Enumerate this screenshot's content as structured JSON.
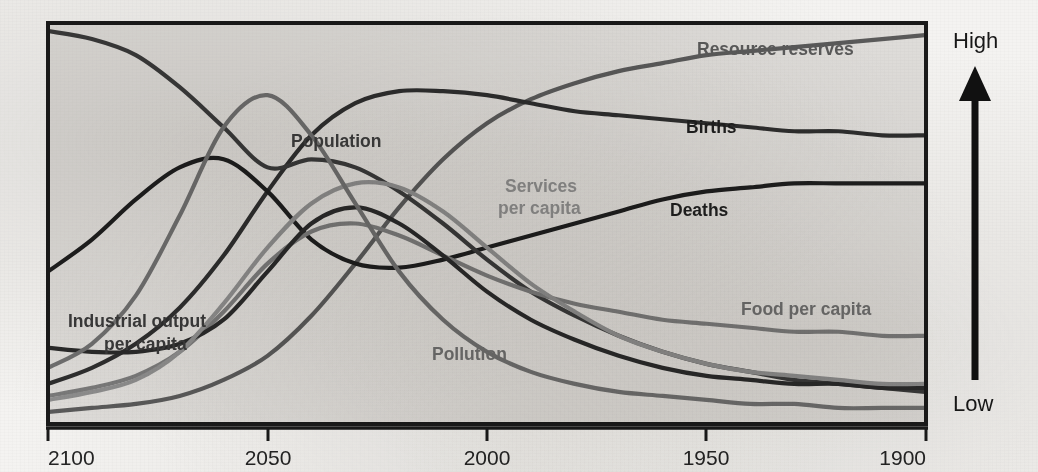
{
  "chart_data": {
    "type": "line",
    "title": "",
    "xlabel": "",
    "ylabel": "",
    "grid": false,
    "legend_position": "inline-labels",
    "x_axis": {
      "tick_labels": [
        "2100",
        "2050",
        "2000",
        "1950",
        "1900"
      ],
      "tick_values": [
        2100,
        2050,
        2000,
        1950,
        1900
      ],
      "direction": "reversed",
      "range": [
        2100,
        1900
      ]
    },
    "y_axis": {
      "low_label": "Low",
      "high_label": "High",
      "ticks": [],
      "range": [
        "Low",
        "High"
      ],
      "arrow": "up"
    },
    "x": [
      1900,
      1910,
      1920,
      1930,
      1940,
      1950,
      1960,
      1970,
      1980,
      1990,
      2000,
      2010,
      2020,
      2030,
      2040,
      2050,
      2060,
      2070,
      2080,
      2090,
      2100
    ],
    "series": [
      {
        "name": "Resource reserves",
        "label": "Resource reserves",
        "color": "#5a5a5a",
        "values": [
          97,
          96,
          95,
          94,
          93,
          92,
          90,
          88,
          85,
          81,
          75,
          66,
          54,
          40,
          27,
          17,
          11,
          7,
          5,
          4,
          3
        ]
      },
      {
        "name": "Births",
        "label": "Births",
        "color": "#2e2e2e",
        "values": [
          72,
          72,
          73,
          73,
          74,
          75,
          76,
          77,
          78,
          80,
          82,
          83,
          83,
          80,
          72,
          58,
          42,
          29,
          20,
          14,
          10
        ]
      },
      {
        "name": "Deaths",
        "label": "Deaths",
        "color": "#1e1e1e",
        "values": [
          60,
          60,
          60,
          60,
          59,
          58,
          56,
          53,
          50,
          47,
          44,
          41,
          39,
          40,
          46,
          58,
          66,
          64,
          56,
          46,
          38
        ]
      },
      {
        "name": "Population",
        "label": "Population",
        "color": "#3a3a3a",
        "values": [
          8,
          9,
          10,
          11,
          13,
          15,
          18,
          22,
          27,
          33,
          41,
          50,
          58,
          64,
          66,
          64,
          74,
          84,
          92,
          96,
          98
        ]
      },
      {
        "name": "Food per capita",
        "label": "Food per capita",
        "color": "#7a7a7a",
        "values": [
          22,
          22,
          23,
          23,
          24,
          25,
          26,
          28,
          30,
          33,
          37,
          42,
          47,
          50,
          48,
          40,
          28,
          18,
          12,
          9,
          7
        ]
      },
      {
        "name": "Industrial output per capita",
        "label": "Industrial output per capita",
        "color": "#2a2a2a",
        "values": [
          9,
          9,
          10,
          10,
          11,
          12,
          14,
          17,
          21,
          26,
          33,
          42,
          50,
          54,
          50,
          38,
          26,
          20,
          18,
          18,
          19
        ]
      },
      {
        "name": "Services per capita",
        "label": "Services per capita",
        "color": "#8d8d8d",
        "values": [
          10,
          10,
          11,
          12,
          13,
          15,
          18,
          22,
          28,
          35,
          44,
          53,
          59,
          60,
          55,
          44,
          30,
          18,
          11,
          8,
          6
        ]
      },
      {
        "name": "Pollution",
        "label": "Pollution",
        "color": "#6f6f6f",
        "values": [
          4,
          4,
          4,
          5,
          5,
          6,
          7,
          8,
          10,
          13,
          18,
          26,
          38,
          55,
          72,
          82,
          74,
          52,
          32,
          20,
          14
        ]
      }
    ],
    "annotations": [
      {
        "text": "Resource reserves",
        "x": 697,
        "y": 55,
        "color": "#5a5a5a",
        "align": "start"
      },
      {
        "text": "Births",
        "x": 686,
        "y": 133,
        "color": "#1f1f1f",
        "align": "start"
      },
      {
        "text": "Deaths",
        "x": 670,
        "y": 216,
        "color": "#1f1f1f",
        "align": "start"
      },
      {
        "text": "Population",
        "x": 291,
        "y": 147,
        "color": "#3d3d3d",
        "align": "start"
      },
      {
        "text": "Services",
        "x": 505,
        "y": 192,
        "color": "#8d8d8d",
        "align": "start"
      },
      {
        "text": "per capita",
        "x": 498,
        "y": 214,
        "color": "#8d8d8d",
        "align": "start"
      },
      {
        "text": "Food per capita",
        "x": 741,
        "y": 315,
        "color": "#6e6e6e",
        "align": "start"
      },
      {
        "text": "Industrial output",
        "x": 68,
        "y": 327,
        "color": "#3a3a3a",
        "align": "start"
      },
      {
        "text": "per capita",
        "x": 104,
        "y": 350,
        "color": "#3a3a3a",
        "align": "start"
      },
      {
        "text": "Pollution",
        "x": 432,
        "y": 360,
        "color": "#6f6f6f",
        "align": "start"
      }
    ]
  },
  "axis": {
    "ticks": [
      {
        "label": "2100",
        "x": 48
      },
      {
        "label": "2050",
        "x": 268
      },
      {
        "label": "2000",
        "x": 487
      },
      {
        "label": "1950",
        "x": 706
      },
      {
        "label": "1900",
        "x": 926
      }
    ]
  },
  "scale": {
    "high": "High",
    "low": "Low"
  },
  "style": {
    "plot_background": "#dedcd9",
    "frame_color": "#1a1a1a",
    "page_background": "#f4f3f1"
  }
}
